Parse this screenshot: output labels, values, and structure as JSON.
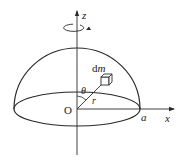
{
  "diagram": {
    "type": "hemisphere-moment-of-inertia",
    "labels": {
      "z_axis": "z",
      "x_axis": "x",
      "origin": "O",
      "mass_element": "dm",
      "mass_element_d": "d",
      "mass_element_m": "m",
      "angle": "θ",
      "radius_vector": "r",
      "radius_edge": "a"
    },
    "colors": {
      "stroke": "#2a2a2a",
      "background": "#ffffff"
    },
    "icons": {
      "rotation": "rotation-arrow-icon",
      "axis_arrow": "arrowhead-icon",
      "mass_element": "cube-icon"
    }
  }
}
